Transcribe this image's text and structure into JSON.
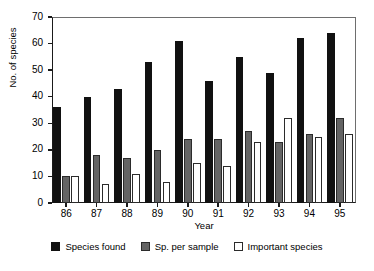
{
  "chart_data": {
    "type": "bar",
    "title": "",
    "xlabel": "Year",
    "ylabel": "No. of species",
    "categories": [
      "86",
      "87",
      "88",
      "89",
      "90",
      "91",
      "92",
      "93",
      "94",
      "95"
    ],
    "series": [
      {
        "name": "Species found",
        "color": "#111111",
        "values": [
          36,
          40,
          43,
          53,
          61,
          46,
          55,
          49,
          62,
          64
        ]
      },
      {
        "name": "Sp. per sample",
        "color": "#646464",
        "values": [
          10,
          18,
          17,
          20,
          24,
          24,
          27,
          23,
          26,
          32
        ]
      },
      {
        "name": "Important species",
        "color": "#ffffff",
        "values": [
          10,
          7,
          11,
          8,
          15,
          14,
          23,
          32,
          25,
          26
        ]
      }
    ],
    "ylim": [
      0,
      70
    ],
    "yticks": [
      0,
      10,
      20,
      30,
      40,
      50,
      60,
      70
    ],
    "grid": false,
    "legend_position": "bottom"
  }
}
